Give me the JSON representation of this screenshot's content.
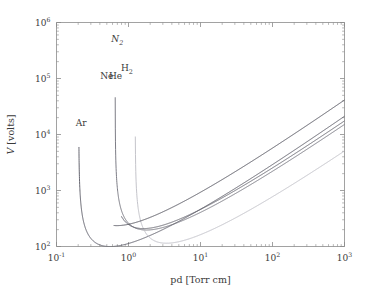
{
  "figure": {
    "background": "#ffffff",
    "frame_color": "#8a8a8a"
  },
  "axes": {
    "x": {
      "label_base": "pd",
      "label_unit": "[Torr cm]",
      "label_full": "pd [Torr cm]",
      "scale": "log",
      "min": 0.1,
      "max": 1000,
      "ticks": [
        {
          "value": 0.1,
          "mantissa": "10",
          "exponent": "-1"
        },
        {
          "value": 1,
          "mantissa": "10",
          "exponent": "0"
        },
        {
          "value": 10,
          "mantissa": "10",
          "exponent": "1"
        },
        {
          "value": 100,
          "mantissa": "10",
          "exponent": "2"
        },
        {
          "value": 1000,
          "mantissa": "10",
          "exponent": "3"
        }
      ]
    },
    "y": {
      "label_base": "V",
      "label_unit": "[volts]",
      "label_full": "V [volts]",
      "scale": "log",
      "min": 100,
      "max": 1000000,
      "ticks": [
        {
          "value": 100,
          "mantissa": "10",
          "exponent": "2"
        },
        {
          "value": 1000,
          "mantissa": "10",
          "exponent": "3"
        },
        {
          "value": 10000,
          "mantissa": "10",
          "exponent": "4"
        },
        {
          "value": 100000,
          "mantissa": "10",
          "exponent": "5"
        },
        {
          "value": 1000000,
          "mantissa": "10",
          "exponent": "6"
        }
      ]
    }
  },
  "chart_data": {
    "type": "line",
    "title": "",
    "xlabel": "pd [Torr cm]",
    "ylabel": "V [volts]",
    "xscale": "log",
    "yscale": "log",
    "xlim": [
      0.1,
      1000
    ],
    "ylim": [
      100,
      1000000
    ],
    "grid": false,
    "legend": "inline-labels",
    "annotations": [
      {
        "text": "Ar",
        "x": 0.22,
        "y": 14000,
        "italic": false
      },
      {
        "text": "Ne",
        "x": 0.5,
        "y": 100000,
        "italic": false
      },
      {
        "text": "He",
        "x": 0.66,
        "y": 100000,
        "italic": false
      },
      {
        "text": "H2",
        "x": 0.95,
        "y": 135000,
        "italic": false
      },
      {
        "text": "N2",
        "x": 0.7,
        "y": 450000,
        "italic": true
      }
    ],
    "series": [
      {
        "name": "Ar",
        "color": "#555560",
        "width": 0.9,
        "paschen_A": 12.0,
        "paschen_B": 180.0,
        "gamma": 0.095,
        "min_pd": 0.27,
        "min_V": 165,
        "asymptote_pd": 0.205,
        "end_pd": 1000,
        "end_V": 12000
      },
      {
        "name": "Ne",
        "color": "#6e6e78",
        "width": 0.9,
        "paschen_A": 4.4,
        "paschen_B": 111.0,
        "gamma": 0.06,
        "min_pd": 0.62,
        "min_V": 160,
        "asymptote_pd": 0.5,
        "end_pd": 1000,
        "end_V": 10500
      },
      {
        "name": "He",
        "color": "#bdbdc4",
        "width": 0.9,
        "paschen_A": 3.0,
        "paschen_B": 34.0,
        "gamma": 0.025,
        "min_pd": 1.55,
        "min_V": 205,
        "asymptote_pd": 0.72,
        "end_pd": 1000,
        "end_V": 14500
      },
      {
        "name": "H2",
        "color": "#5e5e68",
        "width": 0.9,
        "paschen_A": 5.0,
        "paschen_B": 130.0,
        "gamma": 0.055,
        "min_pd": 1.05,
        "min_V": 270,
        "asymptote_pd": 0.8,
        "end_pd": 1000,
        "end_V": 18500
      },
      {
        "name": "N2",
        "color": "#4a4a55",
        "width": 0.9,
        "paschen_A": 12.0,
        "paschen_B": 342.0,
        "gamma": 0.05,
        "min_pd": 0.95,
        "min_V": 400,
        "asymptote_pd": 0.63,
        "end_pd": 1000,
        "end_V": 42000
      }
    ]
  }
}
